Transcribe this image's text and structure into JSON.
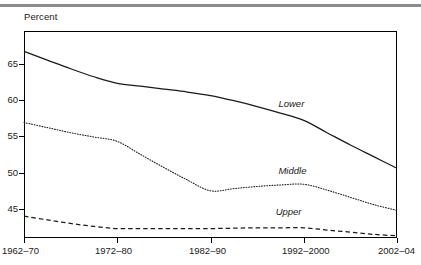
{
  "figure": {
    "y_axis_title": "Percent",
    "has_top_rule": true
  },
  "axes": {
    "y_ticks": [
      {
        "label": "65",
        "value": 65
      },
      {
        "label": "60",
        "value": 60
      },
      {
        "label": "55",
        "value": 55
      },
      {
        "label": "50",
        "value": 50
      },
      {
        "label": "45",
        "value": 45
      }
    ],
    "x_ticks": [
      {
        "label": "1962–70",
        "index": 0
      },
      {
        "label": "1972–80",
        "index": 1
      },
      {
        "label": "1982–90",
        "index": 2
      },
      {
        "label": "1992–2000",
        "index": 3
      },
      {
        "label": "2002–04",
        "index": 4
      }
    ]
  },
  "series_labels": {
    "lower": "Lower",
    "middle": "Middle",
    "upper": "Upper"
  },
  "colors": {
    "line": "#1a1a1a",
    "frame": "#000000",
    "top_rule": "#8c8c8c",
    "text": "#1a1a1a",
    "background": "#ffffff"
  },
  "chart_data": {
    "type": "line",
    "title": "",
    "subtitle": "",
    "xlabel": "",
    "ylabel": "Percent",
    "ylim": [
      41,
      69.5
    ],
    "xlim": [
      0,
      4
    ],
    "grid": false,
    "legend": "inline-annotations",
    "categories": [
      "1962–70",
      "1972–80",
      "1982–90",
      "1992–2000",
      "2002–04"
    ],
    "x": [
      0,
      1,
      2,
      3,
      4
    ],
    "series": [
      {
        "name": "Lower",
        "style": "solid",
        "values": [
          66.7,
          62.3,
          60.6,
          57.2,
          50.6
        ],
        "dense_x": [
          0,
          0.25,
          0.5,
          0.75,
          1,
          1.25,
          1.5,
          1.75,
          2,
          2.25,
          2.5,
          2.75,
          3,
          3.25,
          3.5,
          3.75,
          4
        ],
        "dense_values": [
          66.7,
          65.5,
          64.3,
          63.2,
          62.3,
          61.9,
          61.5,
          61.1,
          60.6,
          59.9,
          59.1,
          58.2,
          57.2,
          55.5,
          53.8,
          52.2,
          50.6
        ]
      },
      {
        "name": "Middle",
        "style": "dotted",
        "values": [
          56.9,
          54.3,
          47.5,
          48.4,
          44.8
        ],
        "dense_x": [
          0,
          0.25,
          0.5,
          0.75,
          1,
          1.25,
          1.5,
          1.75,
          2,
          2.25,
          2.5,
          2.75,
          3,
          3.25,
          3.5,
          3.75,
          4
        ],
        "dense_values": [
          56.9,
          56.2,
          55.5,
          54.9,
          54.3,
          52.5,
          50.7,
          49.0,
          47.5,
          47.8,
          48.1,
          48.3,
          48.4,
          47.6,
          46.6,
          45.6,
          44.8
        ]
      },
      {
        "name": "Upper",
        "style": "dashed",
        "values": [
          44.0,
          42.3,
          42.3,
          42.4,
          41.3
        ],
        "dense_x": [
          0,
          0.25,
          0.5,
          0.75,
          1,
          1.25,
          1.5,
          1.75,
          2,
          2.25,
          2.5,
          2.75,
          3,
          3.25,
          3.5,
          3.75,
          4
        ],
        "dense_values": [
          44.0,
          43.5,
          43.0,
          42.6,
          42.3,
          42.3,
          42.3,
          42.3,
          42.3,
          42.35,
          42.4,
          42.4,
          42.4,
          42.1,
          41.8,
          41.5,
          41.3
        ]
      }
    ],
    "annotations": [
      {
        "text": "Lower",
        "x": 2.75,
        "y": 59.5
      },
      {
        "text": "Middle",
        "x": 2.75,
        "y": 50.2
      },
      {
        "text": "Upper",
        "x": 2.72,
        "y": 44.6
      }
    ]
  }
}
